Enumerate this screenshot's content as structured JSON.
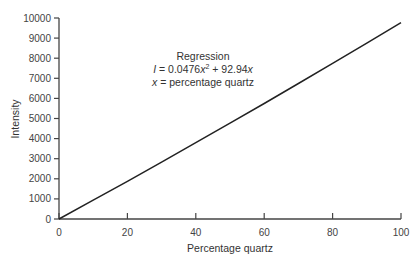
{
  "chart_data": {
    "type": "line",
    "title": "",
    "xlabel": "Percentage quartz",
    "ylabel": "Intensity",
    "xlim": [
      0,
      100
    ],
    "ylim": [
      0,
      10000
    ],
    "x_ticks": [
      0,
      20,
      40,
      60,
      80,
      100
    ],
    "y_ticks": [
      0,
      1000,
      2000,
      3000,
      4000,
      5000,
      6000,
      7000,
      8000,
      9000,
      10000
    ],
    "grid": false,
    "legend": null,
    "annotation": {
      "lines": [
        "Regression",
        "I = 0.0476x² + 92.94x",
        "x = percentage quartz"
      ]
    },
    "series": [
      {
        "name": "Regression fit",
        "equation": "I = 0.0476x^2 + 92.94x",
        "x": [
          0,
          10,
          20,
          30,
          40,
          50,
          60,
          70,
          80,
          90,
          100
        ],
        "values": [
          0,
          934,
          1878,
          2831,
          3794,
          4766,
          5748,
          6739,
          7740,
          8750,
          9770
        ]
      }
    ]
  },
  "labels": {
    "xlabel": "Percentage quartz",
    "ylabel": "Intensity",
    "annot_title": "Regression",
    "annot_eq_lhs": "I",
    "annot_eq_mid": " = 0.0476",
    "annot_eq_x1": "x",
    "annot_eq_exp": "2",
    "annot_eq_rest": " + 92.94",
    "annot_eq_x2": "x",
    "annot_def_x": "x",
    "annot_def_rest": " = percentage quartz"
  }
}
